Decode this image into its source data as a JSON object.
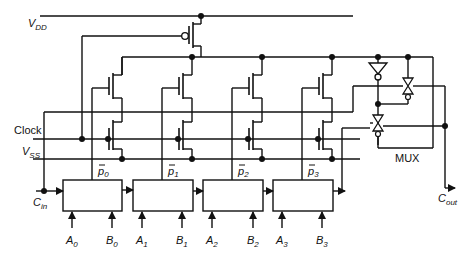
{
  "diagram": {
    "labels": {
      "vdd": "V",
      "vdd_sub": "DD",
      "vss": "V",
      "vss_sub": "SS",
      "clock": "Clock",
      "cin": "C",
      "cin_sub": "in",
      "cout": "C",
      "cout_sub": "out",
      "mux": "MUX"
    },
    "stages": [
      {
        "p_label": "p",
        "p_sub": "0",
        "a_label": "A",
        "a_sub": "0",
        "b_label": "B",
        "b_sub": "0"
      },
      {
        "p_label": "p",
        "p_sub": "1",
        "a_label": "A",
        "a_sub": "1",
        "b_label": "B",
        "b_sub": "1"
      },
      {
        "p_label": "p",
        "p_sub": "2",
        "a_label": "A",
        "a_sub": "2",
        "b_label": "B",
        "b_sub": "2"
      },
      {
        "p_label": "p",
        "p_sub": "3",
        "a_label": "A",
        "a_sub": "3",
        "b_label": "B",
        "b_sub": "3"
      }
    ],
    "components": [
      "pmos-precharge",
      "nmos-pass-transistors",
      "nmos-evaluate-transistors",
      "inverter",
      "transmission-gate-mux",
      "propagate-generate-blocks"
    ]
  }
}
